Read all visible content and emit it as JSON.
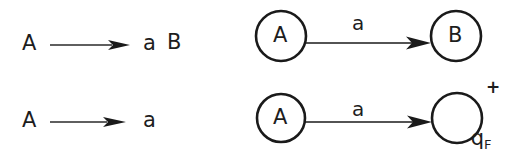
{
  "figure": {
    "kind": "grammar-to-automaton-correspondence",
    "background_color": "#ffffff",
    "ink_color": "#1a1a1a"
  },
  "grammar": {
    "productions": [
      {
        "lhs": "A",
        "arrow": "→",
        "rhs_terminal": "a",
        "rhs_nonterminal": "B"
      },
      {
        "lhs": "A",
        "arrow": "→",
        "rhs_terminal": "a",
        "rhs_nonterminal": ""
      }
    ]
  },
  "automaton": {
    "transitions": [
      {
        "from_state": "A",
        "symbol": "a",
        "to_state": "B",
        "to_state_sub": "",
        "accepting": false,
        "accepting_mark": ""
      },
      {
        "from_state": "A",
        "symbol": "a",
        "to_state": "q",
        "to_state_sub": "F",
        "accepting": true,
        "accepting_mark": "+"
      }
    ]
  }
}
